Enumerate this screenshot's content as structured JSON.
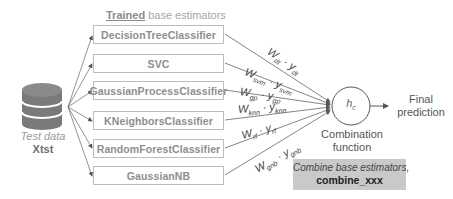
{
  "header": {
    "title_bold": "Trained",
    "title_rest": " base estimators"
  },
  "estimators": [
    {
      "label": "DecisionTreeClassifier",
      "weight": "W",
      "weight_sub": "dt",
      "pred": "y",
      "pred_sub": "dt"
    },
    {
      "label": "SVC",
      "weight": "W",
      "weight_sub": "svm",
      "pred": "y",
      "pred_sub": "svm"
    },
    {
      "label": "GaussianProcessClassifier",
      "weight": "W",
      "weight_sub": "gp",
      "pred": "y",
      "pred_sub": "gp"
    },
    {
      "label": "KNeighborsClassifier",
      "weight": "W",
      "weight_sub": "knn",
      "pred": "y",
      "pred_sub": "knn"
    },
    {
      "label": "RandomForestClassifier",
      "weight": "W",
      "weight_sub": "rf",
      "pred": "y",
      "pred_sub": "rf"
    },
    {
      "label": "GaussianNB",
      "weight": "W",
      "weight_sub": "gnb",
      "pred": "y",
      "pred_sub": "gnb"
    }
  ],
  "data_source": {
    "label": "Test data",
    "name": "Xtst",
    "icon": "database-icon"
  },
  "combiner": {
    "symbol": "h",
    "symbol_sub": "c",
    "label_line1": "Combination",
    "label_line2": "function"
  },
  "output": {
    "line1": "Final",
    "line2": "prediction"
  },
  "note": {
    "line1": "Combine base estimators,",
    "line2": "combine_xxx"
  },
  "separator": "·",
  "colors": {
    "line": "#5a5a5a",
    "box_border": "#bdbdbd",
    "box_text": "#8e8e8e",
    "database": "#777777",
    "note_bg": "#c9c9c9"
  }
}
